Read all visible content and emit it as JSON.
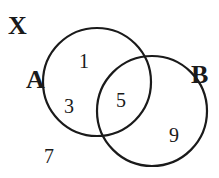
{
  "diagram": {
    "type": "venn",
    "universe_label": "X",
    "sets": [
      {
        "name": "A",
        "cx": 97,
        "cy": 82,
        "r": 54
      },
      {
        "name": "B",
        "cx": 152,
        "cy": 111,
        "r": 55
      }
    ],
    "regions": {
      "a_only_top": "1",
      "a_only_bottom": "3",
      "a_and_b": "5",
      "b_only": "9",
      "outside": "7"
    },
    "stroke_color": "#1a1a1a"
  }
}
